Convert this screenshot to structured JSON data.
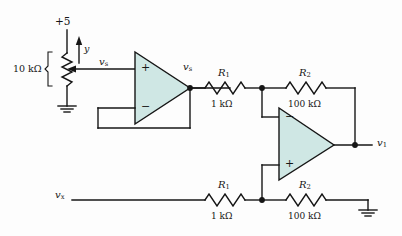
{
  "figure": {
    "type": "circuit-schematic",
    "background_color": "#fdfdfd",
    "wire_color": "#161616",
    "opamp_fill": "#cfe7e4",
    "opamp_stroke": "#161616"
  },
  "labels": {
    "supply": "+5",
    "pot_value": "10 kΩ",
    "wiper_arrow": "y",
    "pot_output": {
      "base": "v",
      "sub": "s"
    },
    "follower_output": {
      "base": "v",
      "sub": "s"
    },
    "input_x": {
      "base": "v",
      "sub": "x"
    },
    "output": {
      "base": "v",
      "sub": "1"
    }
  },
  "resistors": [
    {
      "id": "r1-top",
      "name": {
        "base": "R",
        "sub": "1"
      },
      "value": "1 kΩ"
    },
    {
      "id": "r2-top",
      "name": {
        "base": "R",
        "sub": "2"
      },
      "value": "100 kΩ"
    },
    {
      "id": "r1-bottom",
      "name": {
        "base": "R",
        "sub": "1"
      },
      "value": "1 kΩ"
    },
    {
      "id": "r2-bottom",
      "name": {
        "base": "R",
        "sub": "2"
      },
      "value": "100 kΩ"
    }
  ],
  "opamps": [
    {
      "id": "opamp-follower",
      "plus_position": "top",
      "minus_position": "bottom",
      "plus": "+",
      "minus": "−"
    },
    {
      "id": "opamp-difference",
      "plus_position": "bottom",
      "minus_position": "top",
      "plus": "+",
      "minus": "−"
    }
  ],
  "grounds": [
    {
      "id": "ground-pot"
    },
    {
      "id": "ground-output-rail"
    }
  ]
}
